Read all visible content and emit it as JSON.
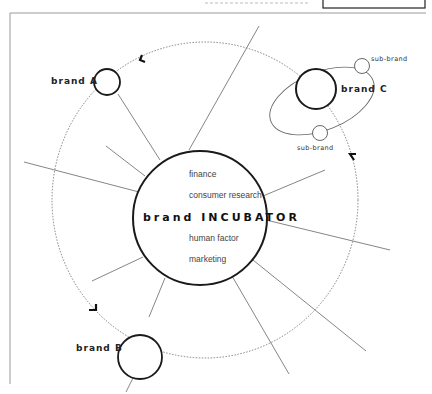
{
  "header": {
    "title_partial": "THE INCUBATOR MODEL",
    "box_label": ""
  },
  "center": {
    "title": "brand INCUBATOR",
    "items": [
      "finance",
      "consumer research",
      "human factor",
      "marketing"
    ]
  },
  "brands": [
    {
      "label": "brand A"
    },
    {
      "label": "brand B"
    },
    {
      "label": "brand C",
      "sub_brands": [
        {
          "label": "sub-brand"
        },
        {
          "label": "sub-brand"
        }
      ]
    }
  ],
  "colors": {
    "stroke_main": "#1a1a1a",
    "stroke_line": "#777777",
    "frame": "#999999",
    "background": "#ffffff"
  }
}
